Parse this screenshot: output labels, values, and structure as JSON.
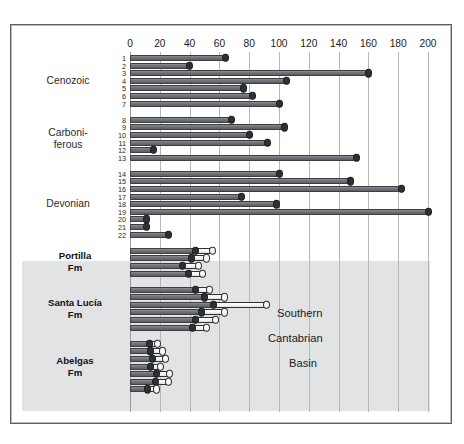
{
  "chart_data": {
    "type": "bar",
    "orientation": "horizontal",
    "title": "Compacted carbonate accummulation rates (m Myr",
    "title_sup": "-1",
    "title_suffix": ")",
    "xlabel": "Compacted carbonate accummulation rates (m Myr^-1)",
    "ylabel": "",
    "xlim": [
      0,
      210
    ],
    "xticks": [
      0,
      20,
      40,
      60,
      80,
      100,
      120,
      140,
      160,
      180,
      200
    ],
    "grid": "vertical",
    "legend": "none",
    "annotation": "Southern Cantabrian Basin",
    "groups": [
      {
        "name": "Cenozoic",
        "label_lines": [
          "Cenozoic"
        ],
        "shaded": false,
        "numbered": true,
        "rows": [
          {
            "num": "1",
            "value": 64,
            "white": 0
          },
          {
            "num": "2",
            "value": 40,
            "white": 0
          },
          {
            "num": "3",
            "value": 160,
            "white": 0
          },
          {
            "num": "4",
            "value": 105,
            "white": 0
          },
          {
            "num": "5",
            "value": 76,
            "white": 0
          },
          {
            "num": "6",
            "value": 82,
            "white": 0
          },
          {
            "num": "7",
            "value": 100,
            "white": 0
          }
        ]
      },
      {
        "name": "Carboniferous",
        "label_lines": [
          "Carboni-",
          "ferous"
        ],
        "shaded": false,
        "numbered": true,
        "rows": [
          {
            "num": "8",
            "value": 68,
            "white": 0
          },
          {
            "num": "9",
            "value": 104,
            "white": 0
          },
          {
            "num": "10",
            "value": 80,
            "white": 0
          },
          {
            "num": "11",
            "value": 92,
            "white": 0
          },
          {
            "num": "12",
            "value": 16,
            "white": 0
          },
          {
            "num": "13",
            "value": 152,
            "white": 0
          }
        ]
      },
      {
        "name": "Devonian",
        "label_lines": [
          "Devonian"
        ],
        "shaded": false,
        "numbered": true,
        "rows": [
          {
            "num": "14",
            "value": 100,
            "white": 0
          },
          {
            "num": "15",
            "value": 148,
            "white": 0
          },
          {
            "num": "16",
            "value": 182,
            "white": 0
          },
          {
            "num": "17",
            "value": 75,
            "white": 0
          },
          {
            "num": "18",
            "value": 98,
            "white": 0
          },
          {
            "num": "19",
            "value": 200,
            "white": 0
          },
          {
            "num": "20",
            "value": 11,
            "white": 0
          },
          {
            "num": "21",
            "value": 11,
            "white": 0
          },
          {
            "num": "22",
            "value": 26,
            "white": 0
          }
        ]
      },
      {
        "name": "Portilla Fm",
        "label_lines": [
          "Portilla",
          "Fm"
        ],
        "shaded": true,
        "numbered": false,
        "rows": [
          {
            "num": "",
            "value": 44,
            "white": 12
          },
          {
            "num": "",
            "value": 41,
            "white": 11
          },
          {
            "num": "",
            "value": 35,
            "white": 11
          },
          {
            "num": "",
            "value": 39,
            "white": 10
          }
        ]
      },
      {
        "name": "Santa Lucia Fm",
        "label_lines": [
          "Santa Lucía",
          "Fm"
        ],
        "shaded": true,
        "numbered": false,
        "rows": [
          {
            "num": "",
            "value": 44,
            "white": 10
          },
          {
            "num": "",
            "value": 50,
            "white": 14
          },
          {
            "num": "",
            "value": 56,
            "white": 36
          },
          {
            "num": "",
            "value": 48,
            "white": 16
          },
          {
            "num": "",
            "value": 44,
            "white": 14
          },
          {
            "num": "",
            "value": 42,
            "white": 10
          }
        ]
      },
      {
        "name": "Abelgas Fm",
        "label_lines": [
          "Abelgas",
          "Fm"
        ],
        "shaded": true,
        "numbered": false,
        "rows": [
          {
            "num": "",
            "value": 13,
            "white": 6
          },
          {
            "num": "",
            "value": 14,
            "white": 8
          },
          {
            "num": "",
            "value": 15,
            "white": 9
          },
          {
            "num": "",
            "value": 14,
            "white": 7
          },
          {
            "num": "",
            "value": 18,
            "white": 9
          },
          {
            "num": "",
            "value": 17,
            "white": 9
          },
          {
            "num": "",
            "value": 12,
            "white": 6
          }
        ]
      }
    ],
    "basin_caption_lines": [
      "Southern",
      "Cantabrian",
      "Basin"
    ],
    "colors": {
      "bar_gray": "#6e7176",
      "bar_white": "#ffffff",
      "cap_dark": "#2e3034",
      "shade": "#e2e3e5",
      "grid": "#b5b7bb",
      "frame": "#5b5f66",
      "text": "#1b1b1b"
    }
  }
}
